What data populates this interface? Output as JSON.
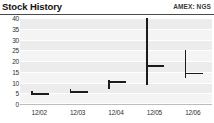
{
  "header": {
    "title": "Stock History",
    "ticker": "AMEX: NGS"
  },
  "chart_data": {
    "type": "bar",
    "title": "Stock History",
    "subtitle": "AMEX: NGS",
    "xlabel": "",
    "ylabel": "",
    "categories": [
      "12/02",
      "12/03",
      "12/04",
      "12/05",
      "12/06"
    ],
    "ylim": [
      0,
      40
    ],
    "yticks": [
      0,
      5,
      10,
      15,
      20,
      25,
      30,
      35,
      40
    ],
    "ytick_labels": [
      "0",
      "5",
      "10",
      "15",
      "20",
      "25",
      "30",
      "35",
      "40"
    ],
    "grid": true,
    "legend": "none",
    "series": [
      {
        "name": "High",
        "values": [
          6,
          7,
          11,
          40,
          25
        ]
      },
      {
        "name": "Low",
        "values": [
          4,
          5,
          7,
          9,
          12
        ]
      },
      {
        "name": "Close",
        "values": [
          5,
          6,
          10.5,
          18,
          14.5
        ]
      }
    ],
    "points": [
      {
        "category": "12/02",
        "high": 6,
        "low": 4,
        "close": 5
      },
      {
        "category": "12/03",
        "high": 7,
        "low": 5,
        "close": 6
      },
      {
        "category": "12/04",
        "high": 11,
        "low": 7,
        "close": 10.5
      },
      {
        "category": "12/05",
        "high": 40,
        "low": 9,
        "close": 18
      },
      {
        "category": "12/06",
        "high": 25,
        "low": 12,
        "close": 14.5
      }
    ]
  },
  "colors": {
    "mark": "#1c1c1c",
    "plot_background": "#ececec",
    "band": "#f4f4f4",
    "gridline": "#ffffff",
    "rule": "#4a4a4a",
    "text": "#2f2f2f"
  }
}
